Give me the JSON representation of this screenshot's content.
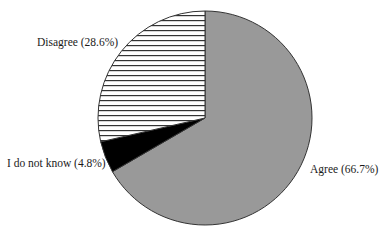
{
  "chart_data": {
    "type": "pie",
    "title": "",
    "start_angle_deg": 0,
    "direction": "clockwise",
    "center": [
      205,
      118
    ],
    "radius": 107,
    "slices": [
      {
        "name": "Agree",
        "value": 66.7,
        "label": "Agree (66.7%)",
        "fill": "#999999",
        "pattern": "solid",
        "label_pos": [
          310,
          163
        ]
      },
      {
        "name": "I do not know",
        "value": 4.8,
        "label": "I do not know (4.8%)",
        "fill": "#000000",
        "pattern": "solid",
        "label_pos": [
          7,
          157
        ]
      },
      {
        "name": "Disagree",
        "value": 28.6,
        "label": "Disagree (28.6%)",
        "fill": "#ffffff",
        "pattern": "horizontal-lines",
        "hatch_color": "#333333",
        "hatch_spacing": 5,
        "label_pos": [
          37,
          36
        ]
      }
    ],
    "outline_color": "#333333",
    "legend": "none"
  },
  "labels": {
    "agree": "Agree (66.7%)",
    "unknown": "I do not know (4.8%)",
    "disagree": "Disagree (28.6%)"
  }
}
